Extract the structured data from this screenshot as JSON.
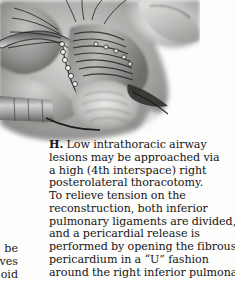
{
  "figure": {
    "panel_label": "H.",
    "alt_description": "grayscale-surgical-illustration-tracheal-anastomosis",
    "caption_lines": [
      "Low intrathoracic airway",
      "lesions may be approached via",
      "a high (4th interspace) right",
      "posterolateral thoracotomy.",
      "To relieve tension on the",
      "reconstruction, both inferior",
      "pulmonary ligaments are divided,",
      "and a pericardial release is",
      "performed by opening the fibrous",
      "pericardium in a “U” fashion",
      "around the right inferior pulmonary"
    ],
    "caption_full": "H. Low intrathoracic airway lesions may be approached via a high (4th interspace) right posterolateral thoracotomy. To relieve tension on the reconstruction, both inferior pulmonary ligaments are divided, and a pericardial release is performed by opening the fibrous pericardium in a “U” fashion around the right inferior pulmonary"
  },
  "adjacent_column_fragment": {
    "lines": [
      "be",
      "olves",
      "oid"
    ]
  },
  "colors": {
    "page_background": "#fdfdfc",
    "text": "#151515",
    "illustration_dark": "#3c3c3c",
    "illustration_mid": "#8e8e8e",
    "illustration_light": "#c9c9c9",
    "illustration_pale": "#e2e2e0"
  }
}
